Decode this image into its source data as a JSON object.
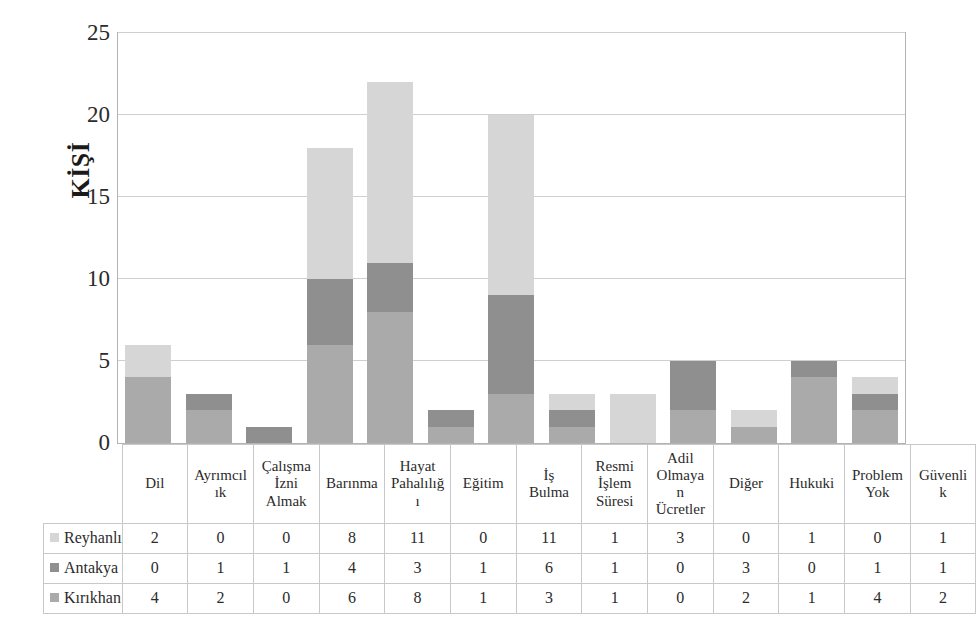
{
  "chart_data": {
    "type": "bar",
    "stacked": true,
    "title": "",
    "xlabel": "",
    "ylabel": "KİŞİ",
    "ylim": [
      0,
      25
    ],
    "yticks": [
      0,
      5,
      10,
      15,
      20,
      25
    ],
    "grid": true,
    "legend_position": "table-left-column",
    "categories": [
      "Dil",
      "Ayrımcılık",
      "Çalışma İzni Almak",
      "Barınma",
      "Hayat Pahalılığı",
      "Eğitim",
      "İş Bulma",
      "Resmi İşlem Süresi",
      "Adil Olmayan Ücretler",
      "Diğer",
      "Hukuki",
      "Problem Yok",
      "Güvenlik"
    ],
    "category_lines": [
      [
        "Dil"
      ],
      [
        "Ayrımcıl",
        "ık"
      ],
      [
        "Çalışma",
        "İzni",
        "Almak"
      ],
      [
        "Barınma"
      ],
      [
        "Hayat",
        "Pahalılığ",
        "ı"
      ],
      [
        "Eğitim"
      ],
      [
        "İş",
        "Bulma"
      ],
      [
        "Resmi",
        "İşlem",
        "Süresi"
      ],
      [
        "Adil",
        "Olmaya",
        "n",
        "Ücretler"
      ],
      [
        "Diğer"
      ],
      [
        "Hukuki"
      ],
      [
        "Problem",
        "Yok"
      ],
      [
        "Güvenli",
        "k"
      ]
    ],
    "series": [
      {
        "name": "Reyhanlı",
        "color": "#d6d6d6",
        "values": [
          2,
          0,
          0,
          8,
          11,
          0,
          11,
          1,
          3,
          0,
          1,
          0,
          1
        ]
      },
      {
        "name": "Antakya",
        "color": "#8f8f8f",
        "values": [
          0,
          1,
          1,
          4,
          3,
          1,
          6,
          1,
          0,
          3,
          0,
          1,
          1
        ]
      },
      {
        "name": "Kırıkhan",
        "color": "#aaaaaa",
        "values": [
          4,
          2,
          0,
          6,
          8,
          1,
          3,
          1,
          0,
          2,
          1,
          4,
          2
        ]
      }
    ],
    "stack_order_bottom_to_top": [
      "Kırıkhan",
      "Antakya",
      "Reyhanlı"
    ],
    "totals": [
      6,
      3,
      1,
      18,
      22,
      2,
      20,
      3,
      3,
      5,
      2,
      5,
      4
    ]
  },
  "axis": {
    "y_title": "KİŞİ",
    "y_tick_labels": [
      "25",
      "20",
      "15",
      "10",
      "5",
      "0"
    ]
  },
  "table": {
    "row_labels": [
      "Reyhanlı",
      "Antakya",
      "Kırıkhan"
    ],
    "swatch_colors": [
      "#d6d6d6",
      "#8f8f8f",
      "#aaaaaa"
    ],
    "rows": [
      [
        "2",
        "0",
        "0",
        "8",
        "11",
        "0",
        "11",
        "1",
        "3",
        "0",
        "1",
        "0",
        "1"
      ],
      [
        "0",
        "1",
        "1",
        "4",
        "3",
        "1",
        "6",
        "1",
        "0",
        "3",
        "0",
        "1",
        "1"
      ],
      [
        "4",
        "2",
        "0",
        "6",
        "8",
        "1",
        "3",
        "1",
        "0",
        "2",
        "1",
        "4",
        "2"
      ]
    ]
  },
  "colors": {
    "reyhanli": "#d6d6d6",
    "antakya": "#8f8f8f",
    "kirikhan": "#aaaaaa",
    "gridline": "#cfcfcf",
    "plot_border": "#b3b3b3",
    "table_border": "#c8c8c8",
    "text": "#2b2b2b"
  }
}
